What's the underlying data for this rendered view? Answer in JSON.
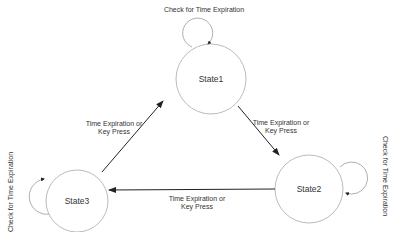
{
  "diagram": {
    "type": "state-machine",
    "states": [
      {
        "id": "state1",
        "label": "State1",
        "cx": 211,
        "cy": 79,
        "r": 35
      },
      {
        "id": "state2",
        "label": "State2",
        "cx": 309,
        "cy": 189,
        "r": 34
      },
      {
        "id": "state3",
        "label": "State3",
        "cx": 77,
        "cy": 201,
        "r": 31
      }
    ],
    "self_loops": [
      {
        "state": "state1",
        "label": "Check for Time Expiration"
      },
      {
        "state": "state2",
        "label": "Check for Time Expiration"
      },
      {
        "state": "state3",
        "label": "Check for Time Expiration"
      }
    ],
    "transitions": [
      {
        "from": "state1",
        "to": "state2",
        "line1": "Time Expiration or",
        "line2": "Key Press"
      },
      {
        "from": "state2",
        "to": "state3",
        "line1": "Time Expiration or",
        "line2": "Key Press"
      },
      {
        "from": "state3",
        "to": "state1",
        "line1": "Time Expiration or",
        "line2": "Key Press"
      }
    ],
    "colors": {
      "stroke": "#999999",
      "arrow": "#222222",
      "text": "#333333"
    }
  }
}
